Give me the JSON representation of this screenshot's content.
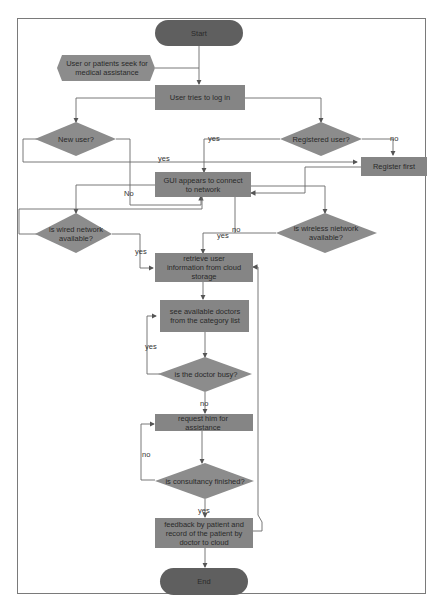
{
  "diagram": {
    "type": "flowchart",
    "colors": {
      "terminator": "#5f5f5f",
      "process": "#858585",
      "decision": "#8c8c8c",
      "connector": "#666666",
      "frame": "#7a7a7a"
    },
    "nodes": {
      "start": "Start",
      "input": "User or patients seek for medical assistance",
      "login": "User tries to log in",
      "new_user": "New user?",
      "registered_user": "Registered user?",
      "register_first": "Register first",
      "gui_connect": "GUI appears to connect to network",
      "wired": "is wired network available?",
      "wireless": "is wireless nietwork available?",
      "retrieve": "retrieve user information from cloud storage",
      "see_doctors": "see available doctors from the category list",
      "doctor_busy": "is the doctor busy?",
      "request": "request him for assistance",
      "consult_finished": "is consultancy finished?",
      "feedback": "feedback by patient and record of the patient by doctor to cloud",
      "end": "End"
    },
    "edge_labels": {
      "new_user_yes": "yes",
      "new_user_no": "No",
      "registered_yes": "yes",
      "registered_no": "no",
      "wired_yes": "yes",
      "gui_no": "no",
      "wireless_yes": "yes",
      "busy_yes": "yes",
      "busy_no": "no",
      "finished_no": "no",
      "finished_yes": "yes"
    }
  }
}
